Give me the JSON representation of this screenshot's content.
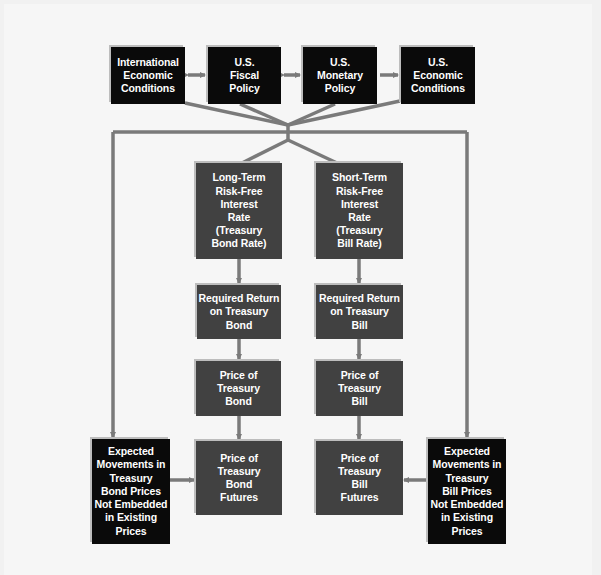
{
  "diagram": {
    "colors": {
      "background": "#f1f1f1",
      "external_box": "#0a0a0a",
      "chain_box": "#414141",
      "connector": "#7a7a7a",
      "text": "#ffffff"
    },
    "top_row": [
      {
        "id": "international",
        "label": "International\nEconomic\nConditions"
      },
      {
        "id": "fiscal",
        "label": "U.S.\nFiscal\nPolicy"
      },
      {
        "id": "monetary",
        "label": "U.S.\nMonetary\nPolicy"
      },
      {
        "id": "us_economic",
        "label": "U.S.\nEconomic\nConditions"
      }
    ],
    "bond_chain": [
      {
        "id": "long_term_rate",
        "label": "Long-Term\nRisk-Free\nInterest\nRate\n(Treasury\nBond Rate)"
      },
      {
        "id": "required_return_bond",
        "label": "Required Return\non Treasury\nBond"
      },
      {
        "id": "price_bond",
        "label": "Price of\nTreasury\nBond"
      },
      {
        "id": "price_bond_futures",
        "label": "Price of\nTreasury\nBond\nFutures"
      }
    ],
    "bill_chain": [
      {
        "id": "short_term_rate",
        "label": "Short-Term\nRisk-Free\nInterest\nRate\n(Treasury\nBill Rate)"
      },
      {
        "id": "required_return_bill",
        "label": "Required Return\non Treasury\nBill"
      },
      {
        "id": "price_bill",
        "label": "Price of\nTreasury\nBill"
      },
      {
        "id": "price_bill_futures",
        "label": "Price of\nTreasury\nBill\nFutures"
      }
    ],
    "expectations": [
      {
        "id": "expected_bond",
        "label": "Expected\nMovements in\nTreasury\nBond Prices\nNot Embedded\nin Existing\nPrices"
      },
      {
        "id": "expected_bill",
        "label": "Expected\nMovements in\nTreasury\nBill Prices\nNot Embedded\nin Existing\nPrices"
      }
    ]
  }
}
